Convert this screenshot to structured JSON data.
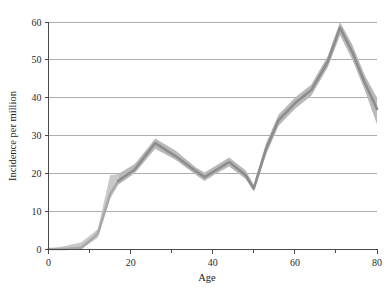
{
  "chart_data": {
    "type": "line",
    "title": "",
    "xlabel": "Age",
    "ylabel": "Incidence per million",
    "xlim": [
      0,
      80
    ],
    "ylim": [
      0,
      62
    ],
    "grid": true,
    "legend_position": "none",
    "x_ticks_major": [
      0,
      20,
      40,
      60,
      80
    ],
    "x_ticks_minor": [
      10,
      30,
      50,
      70
    ],
    "y_ticks": [
      0,
      10,
      20,
      30,
      40,
      50,
      60
    ],
    "x_tick_labels": [
      "0",
      "20",
      "40",
      "60",
      "80"
    ],
    "y_tick_labels": [
      "0",
      "10",
      "20",
      "30",
      "40",
      "50",
      "60"
    ],
    "series": [
      {
        "name": "Incidence",
        "style": "line-with-confidence-band",
        "line_color": "#8d8d8d",
        "band_color": "#b9b9b9",
        "band_color_young": "#c9c9c9",
        "line_color_young": "#a8a8a8",
        "x": [
          0,
          4,
          8,
          12,
          15,
          17,
          21,
          26,
          31,
          36,
          38,
          41,
          44,
          48,
          50,
          53,
          56,
          60,
          64,
          68,
          71,
          74,
          77,
          80
        ],
        "values": [
          0,
          0,
          0.3,
          4.0,
          14.5,
          18.0,
          21.0,
          28.0,
          24.5,
          20.5,
          19.0,
          21.0,
          23.0,
          19.5,
          16.0,
          26.5,
          34.0,
          38.5,
          42.0,
          49.5,
          58.5,
          52.0,
          44.0,
          37.0
        ],
        "lower": [
          0,
          0,
          0,
          3.0,
          13.2,
          17.0,
          20.0,
          26.5,
          23.5,
          19.5,
          18.0,
          20.0,
          21.8,
          18.5,
          15.2,
          25.0,
          32.5,
          37.0,
          40.5,
          48.0,
          56.5,
          50.0,
          42.0,
          33.0
        ],
        "upper": [
          0,
          0.8,
          1.8,
          5.2,
          19.5,
          19.8,
          22.5,
          29.2,
          26.0,
          21.5,
          20.2,
          22.2,
          24.2,
          20.8,
          17.0,
          28.0,
          35.5,
          40.0,
          43.5,
          51.0,
          60.0,
          54.0,
          46.0,
          40.0
        ]
      }
    ]
  },
  "axes": {
    "x_label": "Age",
    "y_label": "Incidence per million"
  }
}
